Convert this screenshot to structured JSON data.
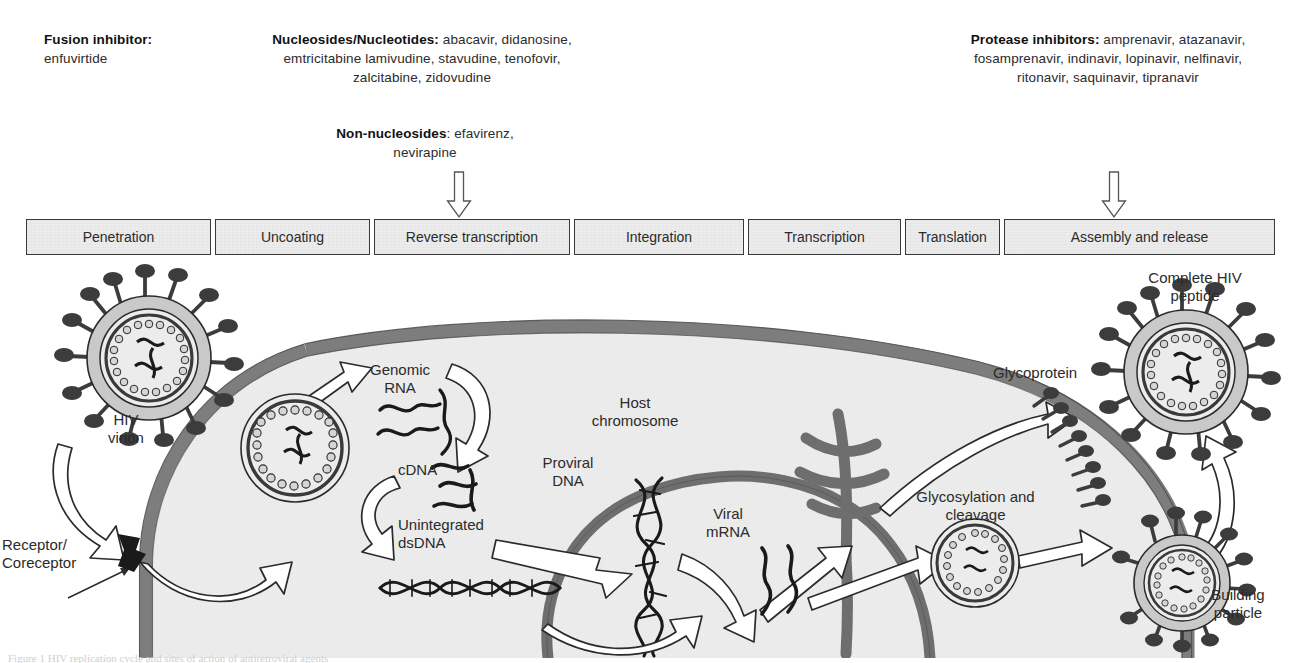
{
  "figure": {
    "colors": {
      "cell_fill": "#ececec",
      "membrane": "#7d7d7d",
      "organelle": "#6e6e6e",
      "capsid_fill": "#c9c9c9",
      "spike": "#3c3c3c",
      "box_fill": "#ececec",
      "box_border": "#3a3a3a",
      "text": "#2b2b2b"
    }
  },
  "drug_classes": [
    {
      "id": "fusion",
      "heading": "Fusion inhibitor:",
      "drugs": "enfuvirtide",
      "target_stage": "Penetration",
      "has_arrow": false
    },
    {
      "id": "nrti",
      "heading": "Nucleosides/Nucleotides:",
      "drugs": " abacavir, didanosine, emtricitabine lamivudine, stavudine, tenofovir, zalcitabine, zidovudine",
      "target_stage": "Reverse transcription",
      "has_arrow": true
    },
    {
      "id": "nnrti",
      "heading": "Non-nucleosides",
      "drugs": ": efavirenz, nevirapine",
      "target_stage": "Reverse transcription",
      "has_arrow": true
    },
    {
      "id": "protease",
      "heading": "Protease inhibitors:",
      "drugs": " amprenavir, atazanavir, fosamprenavir, indinavir, lopinavir, nelfinavir, ritonavir, saquinavir, tipranavir",
      "target_stage": "Assembly and release",
      "has_arrow": true
    }
  ],
  "stages": [
    {
      "label": "Penetration",
      "x": 0,
      "w": 185
    },
    {
      "label": "Uncoating",
      "x": 189,
      "w": 155
    },
    {
      "label": "Reverse transcription",
      "x": 348,
      "w": 196
    },
    {
      "label": "Integration",
      "x": 548,
      "w": 170
    },
    {
      "label": "Transcription",
      "x": 722,
      "w": 153
    },
    {
      "label": "Translation",
      "x": 879,
      "w": 95
    },
    {
      "label": "Assembly and release",
      "x": 978,
      "w": 271
    }
  ],
  "stage_arrows": [
    {
      "for_stage": "Reverse transcription",
      "x": 446,
      "y": 171
    },
    {
      "for_stage": "Assembly and release",
      "x": 1101,
      "y": 171
    }
  ],
  "figure_labels": [
    {
      "id": "hiv-virion",
      "text": "HIV\nvirion",
      "x": 86,
      "y": 153,
      "w": 80
    },
    {
      "id": "receptor",
      "text": "Receptor/\nCoreceptor",
      "x": 2,
      "y": 278,
      "w": 120,
      "align": "left"
    },
    {
      "id": "genomic-rna",
      "text": "Genomic\nRNA",
      "x": 355,
      "y": 103,
      "w": 90
    },
    {
      "id": "cdna",
      "text": "cDNA",
      "x": 398,
      "y": 203,
      "w": 56,
      "align": "left"
    },
    {
      "id": "unintegrated-dsdna",
      "text": "Unintegrated\ndsDNA",
      "x": 398,
      "y": 258,
      "w": 120,
      "align": "left"
    },
    {
      "id": "host-chromosome",
      "text": "Host\nchromosome",
      "x": 570,
      "y": 136,
      "w": 130
    },
    {
      "id": "proviral-dna",
      "text": "Proviral\nDNA",
      "x": 520,
      "y": 196,
      "w": 96
    },
    {
      "id": "viral-mrna",
      "text": "Viral\nmRNA",
      "x": 690,
      "y": 247,
      "w": 76
    },
    {
      "id": "glycosylation",
      "text": "Glycosylation and\ncleavage",
      "x": 893,
      "y": 230,
      "w": 165
    },
    {
      "id": "glycoprotein",
      "text": "Glycoprotein",
      "x": 993,
      "y": 106,
      "w": 110,
      "align": "left"
    },
    {
      "id": "complete-hiv",
      "text": "Complete HIV\npeptide",
      "x": 1125,
      "y": 11,
      "w": 140
    },
    {
      "id": "building-particle",
      "text": "Building\nparticle",
      "x": 1190,
      "y": 328,
      "w": 96
    }
  ],
  "caption_sliver": "Figure 1  HIV replication cycle and sites of action of antiretroviral agents"
}
